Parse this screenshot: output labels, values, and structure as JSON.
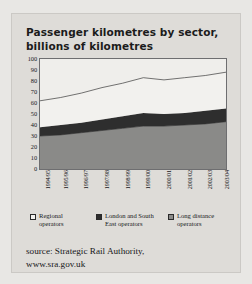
{
  "title": "Passenger kilometres by sector, billions of kilometres",
  "source": "source: Strategic Rail Authority,\nwww.sra.gov.uk",
  "legend": [
    {
      "label": "Regional\noperators",
      "color": "#f2f1ee",
      "name": "regional-operators"
    },
    {
      "label": "London and South\nEast operators",
      "color": "#2e2e2e",
      "name": "london-south-east-operators"
    },
    {
      "label": "Long distance\noperators",
      "color": "#8a8a88",
      "name": "long-distance-operators"
    }
  ],
  "colors": {
    "regional": "#f2f1ee",
    "london_south_east": "#2e2e2e",
    "long_distance": "#8a8a88",
    "axis": "#6e6e70",
    "page": "#dedcd8",
    "text": "#17171a"
  },
  "chart_data": {
    "type": "area",
    "stacked": true,
    "title": "Passenger kilometres by sector, billions of kilometres",
    "xlabel": "",
    "ylabel": "",
    "ylim": [
      0,
      100
    ],
    "yticks": [
      0,
      10,
      20,
      30,
      40,
      50,
      60,
      70,
      80,
      90,
      100
    ],
    "grid": false,
    "legend_position": "bottom",
    "categories": [
      "1994/95",
      "1995/96",
      "1996/97",
      "1997/98",
      "1998/99",
      "1999/00",
      "2000/01",
      "2001/02",
      "2002/03",
      "2003/04"
    ],
    "series": [
      {
        "name": "Long distance operators",
        "values": [
          30,
          31,
          33,
          35,
          37,
          39,
          39,
          40,
          41,
          43
        ]
      },
      {
        "name": "London and South East operators",
        "values": [
          8,
          9,
          9,
          10,
          11,
          12,
          11,
          11,
          12,
          12
        ]
      },
      {
        "name": "Regional operators",
        "values": [
          24,
          25,
          27,
          29,
          30,
          32,
          31,
          32,
          32,
          33
        ]
      }
    ],
    "totals": [
      62,
      65,
      69,
      74,
      78,
      83,
      81,
      83,
      85,
      88
    ]
  }
}
